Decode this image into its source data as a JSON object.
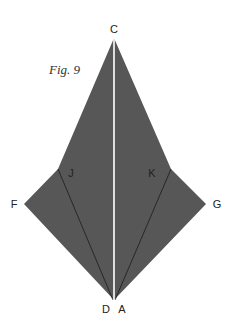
{
  "figure": {
    "caption": "Fig. 9",
    "fill_color": "#575757",
    "fold_line_color": "#1a1a1a",
    "center_line_color": "#ffffff",
    "points": {
      "C": "C",
      "D": "D",
      "A": "A",
      "F": "F",
      "G": "G",
      "J": "J",
      "K": "K"
    }
  }
}
